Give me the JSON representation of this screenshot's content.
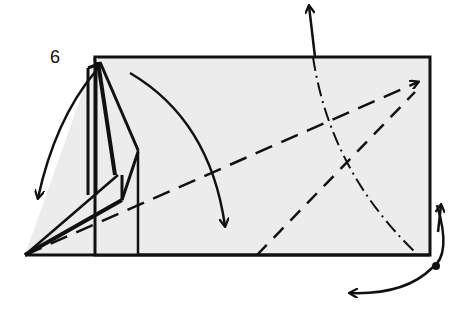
{
  "diagram": {
    "step_number": "6",
    "colors": {
      "paper_fill": "#ececec",
      "line": "#111111",
      "background": "#ffffff"
    },
    "elements": [
      {
        "type": "paper-rectangle",
        "x1": 95,
        "y1": 57,
        "x2": 430,
        "y2": 255
      },
      {
        "type": "left-flap-layers",
        "apex": [
          25,
          255
        ]
      },
      {
        "type": "valley-fold-line",
        "from": [
          25,
          255
        ],
        "to": [
          425,
          78
        ]
      },
      {
        "type": "valley-fold-line",
        "from": [
          257,
          255
        ],
        "to": [
          415,
          92
        ]
      },
      {
        "type": "mountain-fold-curve",
        "from": [
          313,
          57
        ],
        "to": [
          415,
          252
        ]
      },
      {
        "type": "arrow",
        "meaning": "fold flap down-left",
        "from": [
          97,
          70
        ],
        "to": [
          38,
          200
        ]
      },
      {
        "type": "arrow",
        "meaning": "fold top down",
        "from": [
          130,
          73
        ],
        "to": [
          225,
          228
        ]
      },
      {
        "type": "arrow",
        "meaning": "pull up",
        "from": [
          313,
          57
        ],
        "to": [
          308,
          5
        ]
      },
      {
        "type": "arrow",
        "meaning": "turn over",
        "from": [
          437,
          205
        ],
        "to": [
          350,
          292
        ]
      }
    ]
  }
}
